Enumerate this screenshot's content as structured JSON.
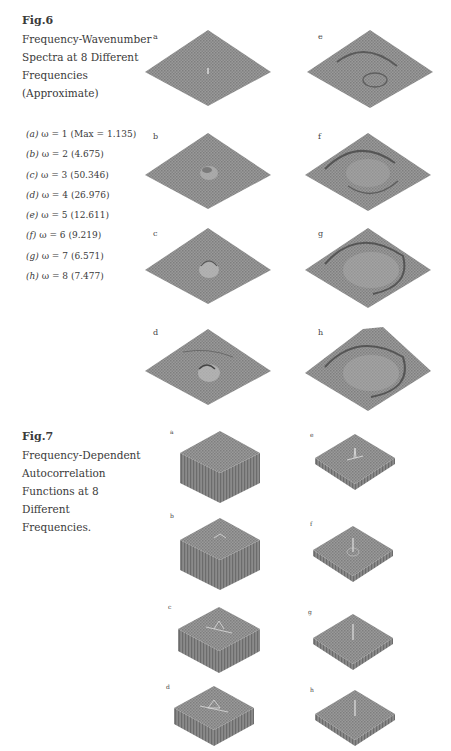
{
  "fig6": {
    "number": "Fig.6",
    "title_lines": [
      "Frequency-Wavenumber",
      "Spectra at 8 Different",
      "Frequencies",
      "(Approximate)"
    ],
    "legend": [
      {
        "panel": "(a)",
        "omega": "ω = 1",
        "value": "(Max = 1.135)"
      },
      {
        "panel": "(b)",
        "omega": "ω = 2",
        "value": "(4.675)"
      },
      {
        "panel": "(c)",
        "omega": "ω = 3",
        "value": "(50.346)"
      },
      {
        "panel": "(d)",
        "omega": "ω = 4",
        "value": "(26.976)"
      },
      {
        "panel": "(e)",
        "omega": "ω = 5",
        "value": "(12.611)"
      },
      {
        "panel": "(f)",
        "omega": "ω = 6",
        "value": "(9.219)"
      },
      {
        "panel": "(g)",
        "omega": "ω = 7",
        "value": "(6.571)"
      },
      {
        "panel": "(h)",
        "omega": "ω = 8",
        "value": "(7.477)"
      }
    ],
    "panels": [
      {
        "label": "a",
        "feature": "small central spike"
      },
      {
        "label": "b",
        "feature": "small central bump"
      },
      {
        "label": "c",
        "feature": "central peak"
      },
      {
        "label": "d",
        "feature": "central peak with ridge"
      },
      {
        "label": "e",
        "feature": "ring ridge plus bump"
      },
      {
        "label": "f",
        "feature": "larger ring ridge"
      },
      {
        "label": "g",
        "feature": "large ring ridge"
      },
      {
        "label": "h",
        "feature": "large ring ridge, raised corner"
      }
    ]
  },
  "fig7": {
    "number": "Fig.7",
    "title_lines": [
      "Frequency-Dependent",
      "Autocorrelation",
      "Functions at 8",
      "Different",
      "Frequencies."
    ],
    "panels": [
      {
        "label": "a",
        "shape": "tall box"
      },
      {
        "label": "b",
        "shape": "tall box"
      },
      {
        "label": "c",
        "shape": "medium box"
      },
      {
        "label": "d",
        "shape": "short box"
      },
      {
        "label": "e",
        "shape": "thin slab with spike"
      },
      {
        "label": "f",
        "shape": "thin slab with spike"
      },
      {
        "label": "g",
        "shape": "thin slab with spike"
      },
      {
        "label": "h",
        "shape": "thin slab with spike"
      }
    ]
  },
  "colors": {
    "surface": "#8c8c8c",
    "surface_dark": "#6e6e6e",
    "side": "#7a7a7a",
    "text": "#3a3a3a"
  }
}
